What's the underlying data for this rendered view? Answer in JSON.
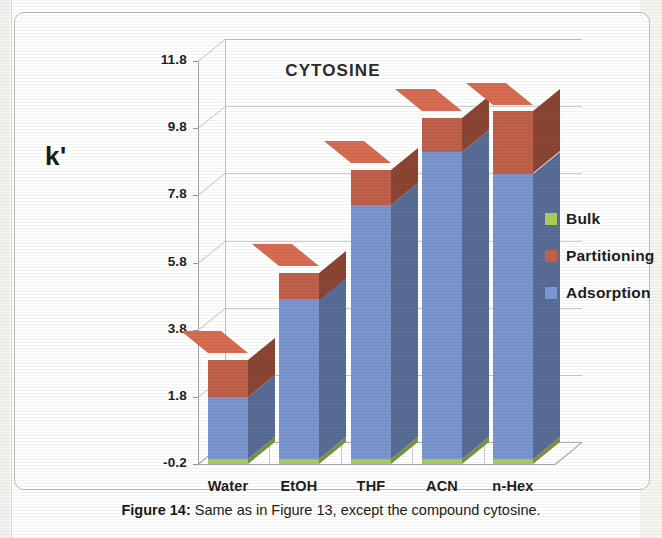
{
  "caption": {
    "prefix": "Figure 14:",
    "text": " Same as in Figure 13, except the compound cytosine."
  },
  "axis": {
    "y_title": "k'",
    "y_ticks": [
      "11.8",
      "9.8",
      "7.8",
      "5.8",
      "3.8",
      "1.8",
      "-0.2"
    ]
  },
  "legend": {
    "items": [
      {
        "label": "Bulk",
        "color": "#a8cc5a"
      },
      {
        "label": "Partitioning",
        "color": "#c0604a"
      },
      {
        "label": "Adsorption",
        "color": "#7a96cf"
      }
    ]
  },
  "chart_data": {
    "type": "bar",
    "stacked": true,
    "three_d": true,
    "title": "CYTOSINE",
    "xlabel": "",
    "ylabel": "k'",
    "ylim": [
      -0.2,
      11.8
    ],
    "ytick_values": [
      -0.2,
      1.8,
      3.8,
      5.8,
      7.8,
      9.8,
      11.8
    ],
    "grid": "horizontal",
    "legend_position": "right",
    "categories": [
      "Water",
      "EtOH",
      "THF",
      "ACN",
      "n-Hex"
    ],
    "series": [
      {
        "name": "Bulk",
        "color": "#a8cc5a",
        "values": [
          0.15,
          0.15,
          0.15,
          0.15,
          0.15
        ]
      },
      {
        "name": "Adsorption",
        "color": "#7a96cf",
        "values": [
          1.85,
          4.75,
          7.55,
          9.15,
          8.5
        ]
      },
      {
        "name": "Partitioning",
        "color": "#c0604a",
        "values": [
          1.1,
          0.8,
          1.05,
          1.0,
          1.85
        ]
      }
    ],
    "totals": [
      3.1,
      5.7,
      8.75,
      10.3,
      10.5
    ]
  }
}
